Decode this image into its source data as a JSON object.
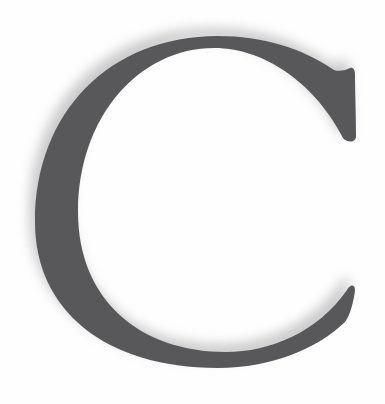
{
  "image": {
    "letter": "C",
    "letter_color": "#58585a",
    "shadow_color": "#bdbdbd",
    "background_color": "#fefefe"
  }
}
